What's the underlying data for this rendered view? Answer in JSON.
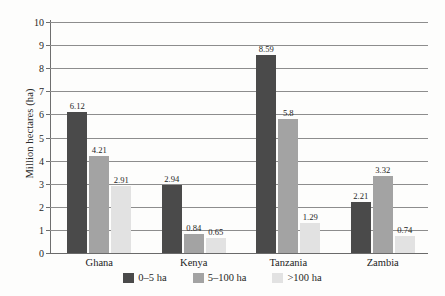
{
  "chart_data": {
    "type": "bar",
    "title": "",
    "subtitle": "",
    "xlabel": "",
    "ylabel": "Million hectares (ha)",
    "ylim": [
      0,
      10
    ],
    "ytick_step": 1,
    "yticks": [
      "10",
      "9",
      "8",
      "7",
      "6",
      "5",
      "4",
      "3",
      "2",
      "1",
      "0"
    ],
    "grid": true,
    "legend_position": "bottom-center",
    "categories": [
      "Ghana",
      "Kenya",
      "Tanzania",
      "Zambia"
    ],
    "series": [
      {
        "name": "0–5 ha",
        "color": "#4a4a4a",
        "values": [
          6.12,
          2.94,
          8.59,
          2.21
        ],
        "labels": [
          "6.12",
          "2.94",
          "8.59",
          "2.21"
        ]
      },
      {
        "name": "5–100 ha",
        "color": "#a3a3a3",
        "values": [
          4.21,
          0.84,
          5.8,
          3.32
        ],
        "labels": [
          "4.21",
          "0.84",
          "5.8",
          "3.32"
        ]
      },
      {
        "name": ">100 ha",
        "color": "#e2e2e2",
        "values": [
          2.91,
          0.65,
          1.29,
          0.74
        ],
        "labels": [
          "2.91",
          "0.65",
          "1.29",
          "0.74"
        ]
      }
    ]
  },
  "axis": {
    "y_title": "Million hectares (ha)",
    "ticks": [
      "10",
      "9",
      "8",
      "7",
      "6",
      "5",
      "4",
      "3",
      "2",
      "1",
      "0"
    ]
  },
  "categories": {
    "0": "Ghana",
    "1": "Kenya",
    "2": "Tanzania",
    "3": "Zambia"
  },
  "legend": {
    "items": [
      {
        "label": "0–5 ha",
        "color": "#4a4a4a"
      },
      {
        "label": "5–100 ha",
        "color": "#a3a3a3"
      },
      {
        "label": ">100 ha",
        "color": "#e2e2e2"
      }
    ]
  },
  "values": {
    "ghana": {
      "s0": "6.12",
      "s1": "4.21",
      "s2": "2.91"
    },
    "kenya": {
      "s0": "2.94",
      "s1": "0.84",
      "s2": "0.65"
    },
    "tanzania": {
      "s0": "8.59",
      "s1": "5.8",
      "s2": "1.29"
    },
    "zambia": {
      "s0": "2.21",
      "s1": "3.32",
      "s2": "0.74"
    }
  }
}
